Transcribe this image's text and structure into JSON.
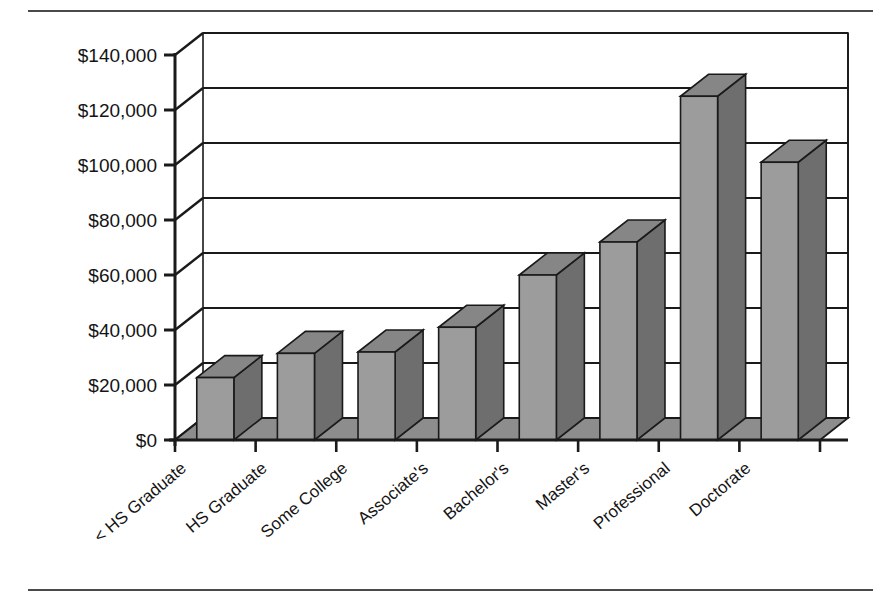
{
  "figure": {
    "separator_top": "horizontal-rule",
    "separator_bottom": "horizontal-rule"
  },
  "chart_data": {
    "type": "bar",
    "title": "",
    "subtitle": "",
    "xlabel": "",
    "ylabel": "",
    "style": "3d-column",
    "grid": true,
    "grid_axis": "y",
    "legend": "none",
    "categories": [
      "< HS Graduate",
      "HS Graduate",
      "Some College",
      "Associate's",
      "Bachelor's",
      "Master's",
      "Professional",
      "Doctorate"
    ],
    "values": [
      22700,
      31500,
      32000,
      41000,
      60000,
      72000,
      125000,
      101000
    ],
    "ylim": [
      0,
      140000
    ],
    "ytick_values": [
      0,
      20000,
      40000,
      60000,
      80000,
      100000,
      120000,
      140000
    ],
    "ytick_labels": [
      "$0",
      "$20,000",
      "$40,000",
      "$60,000",
      "$80,000",
      "$100,000",
      "$120,000",
      "$140,000"
    ],
    "bar_color": "#9c9c9c",
    "bar_side_color": "#6e6e6e",
    "bar_top_color": "#868686",
    "floor_color": "#8d8d8d",
    "outline_color": "#1a1a1a",
    "axis_color": "#1a1a1a",
    "background": "#ffffff"
  }
}
